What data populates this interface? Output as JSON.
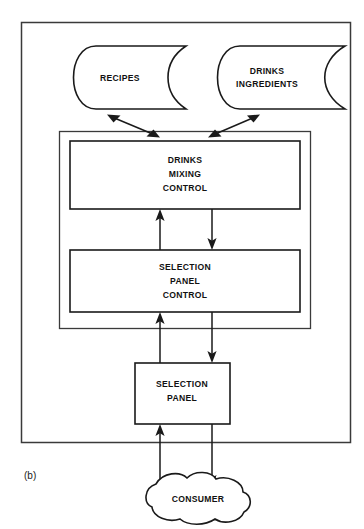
{
  "figure": {
    "caption": "(b)",
    "background_color": "#ffffff",
    "line_color": "#1a1a1a",
    "frame_color": "#3a3a3a"
  },
  "data_stores": [
    {
      "id": "recipes",
      "label": "RECIPES",
      "lines": [
        "RECIPES"
      ]
    },
    {
      "id": "drinks-ingredients",
      "label": "DRINKS INGREDIENTS",
      "lines": [
        "DRINKS",
        "INGREDIENTS"
      ]
    }
  ],
  "processes": [
    {
      "id": "drinks-mixing-control",
      "label": "DRINKS MIXING CONTROL",
      "lines": [
        "DRINKS",
        "MIXING",
        "CONTROL"
      ]
    },
    {
      "id": "selection-panel-control",
      "label": "SELECTION PANEL CONTROL",
      "lines": [
        "SELECTION",
        "PANEL",
        "CONTROL"
      ]
    },
    {
      "id": "selection-panel",
      "label": "SELECTION PANEL",
      "lines": [
        "SELECTION",
        "PANEL"
      ]
    }
  ],
  "external_entities": [
    {
      "id": "consumer",
      "label": "CONSUMER",
      "lines": [
        "CONSUMER"
      ]
    }
  ],
  "flows": [
    {
      "id": "recipes-mixing",
      "from": "recipes",
      "to": "drinks-mixing-control",
      "direction": "bidirectional"
    },
    {
      "id": "ingredients-mixing",
      "from": "drinks-mixing-control",
      "to": "drinks-ingredients",
      "direction": "bidirectional"
    },
    {
      "id": "panelctl-mixing",
      "from": "selection-panel-control",
      "to": "drinks-mixing-control",
      "direction": "up"
    },
    {
      "id": "mixing-panelctl",
      "from": "drinks-mixing-control",
      "to": "selection-panel-control",
      "direction": "down"
    },
    {
      "id": "panel-panelctl",
      "from": "selection-panel",
      "to": "selection-panel-control",
      "direction": "up"
    },
    {
      "id": "panelctl-panel",
      "from": "selection-panel-control",
      "to": "selection-panel",
      "direction": "down"
    },
    {
      "id": "consumer-panel",
      "from": "consumer",
      "to": "selection-panel",
      "direction": "up"
    },
    {
      "id": "panel-consumer",
      "from": "selection-panel",
      "to": "consumer",
      "direction": "down"
    }
  ]
}
